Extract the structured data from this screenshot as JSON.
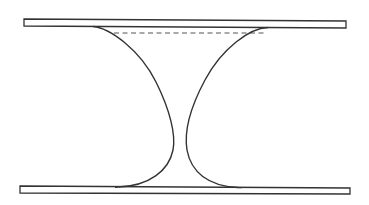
{
  "diagram": {
    "colors": {
      "background": "#ffffff",
      "stroke": "#333333",
      "dash": "#555555"
    },
    "elements": {
      "top_plate": {
        "x1": 24,
        "y1": 19,
        "x2": 346,
        "y2": 28
      },
      "bottom_plate": {
        "x1": 20,
        "y1": 186,
        "x2": 350,
        "y2": 194
      },
      "dashed_line": {
        "x1": 114,
        "x2": 264,
        "y": 33
      },
      "left_profile": "concave meniscus, left side",
      "right_profile": "concave meniscus, right side"
    }
  }
}
